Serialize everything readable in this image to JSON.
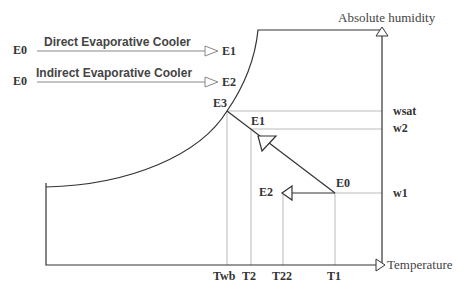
{
  "legend": {
    "direct": {
      "start": "E0",
      "label": "Direct Evaporative Cooler",
      "end": "E1"
    },
    "indirect": {
      "start": "E0",
      "label": "Indirect Evaporative Cooler",
      "end": "E2"
    }
  },
  "axes": {
    "y_label": "Absolute humidity",
    "x_label": "Temperature"
  },
  "points": {
    "e0": "E0",
    "e1": "E1",
    "e2": "E2",
    "e3": "E3"
  },
  "humidity_levels": {
    "wsat": "wsat",
    "w2": "w2",
    "w1": "w1"
  },
  "temperatures": {
    "twb": "Twb",
    "t2": "T2",
    "t22": "T22",
    "t1": "T1"
  },
  "colors": {
    "line": "#333333",
    "guide": "#bbbbbb",
    "legend_line": "#888888"
  }
}
